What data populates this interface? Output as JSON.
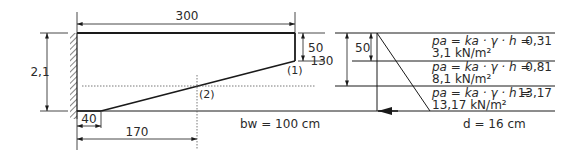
{
  "diagram": {
    "type": "retaining-wall-section",
    "dimensions": {
      "top_length": "300",
      "height": "2,1",
      "right_edge_height": "50",
      "toe_offset": "40",
      "point2_offset": "170",
      "pressure_top_height": "50",
      "pressure_mid_height": "130"
    },
    "points": {
      "point1": "(1)",
      "point2": "(2)"
    },
    "labels": {
      "bw": "bw = 100 cm",
      "d": "d = 16 cm"
    },
    "pressures": [
      {
        "formula_pa": "pa",
        "formula_rest": " = ka · γ · h = ",
        "value": "0,31",
        "result": "3,1 kN/m²"
      },
      {
        "formula_pa": "pa",
        "formula_rest": " = ka · γ · h = ",
        "value": "0,81",
        "result": "8,1 kN/m²"
      },
      {
        "formula_pa": "pa",
        "formula_rest": " = ka · γ · h = ",
        "value": "13,17",
        "result": "13,17 kN/m²"
      }
    ],
    "colors": {
      "line": "#1a1a1a",
      "text": "#2a2a2a",
      "background": "#ffffff"
    }
  }
}
